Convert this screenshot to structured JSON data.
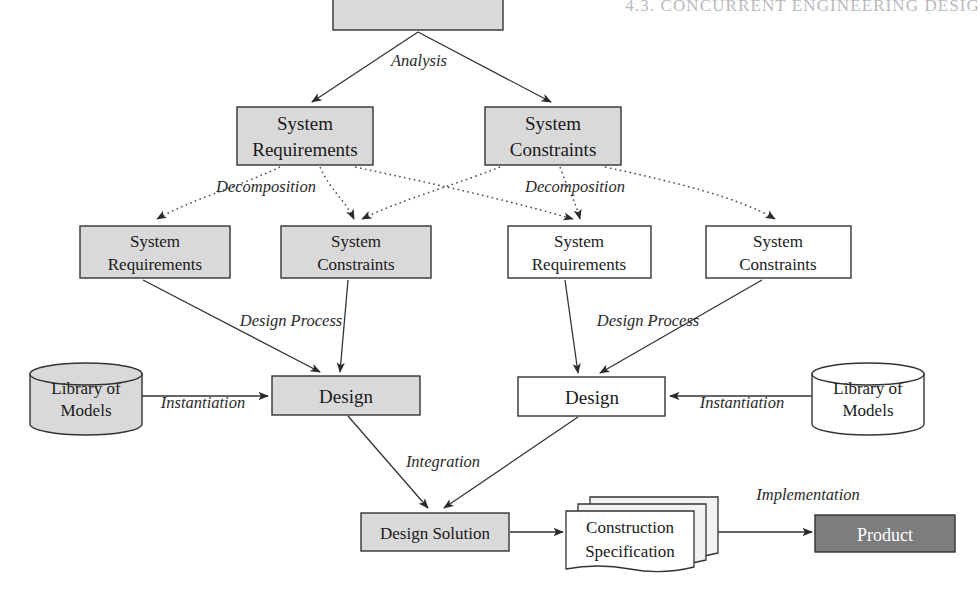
{
  "page": {
    "running_header": "4.3. CONCURRENT ENGINEERING DESIG",
    "width": 980,
    "height": 598
  },
  "colors": {
    "fill_gray": "#d4d4d4",
    "fill_white": "#ffffff",
    "fill_dark": "#7d7d7d",
    "stroke": "#333333",
    "header_text": "#b9b9bd",
    "text_dark": "#1a1a1a",
    "text_light": "#ffffff"
  },
  "diagram": {
    "nodes": [
      {
        "id": "need",
        "name": "need-box",
        "shape": "rect",
        "label": "",
        "fill": "gray",
        "x": 333,
        "y": -18,
        "w": 170,
        "h": 48
      },
      {
        "id": "sys-req-1",
        "name": "system-requirements-box-level1",
        "shape": "rect",
        "label_line1": "System",
        "label_line2": "Requirements",
        "fill": "gray",
        "x": 237,
        "y": 107,
        "w": 136,
        "h": 58
      },
      {
        "id": "sys-con-1",
        "name": "system-constraints-box-level1",
        "shape": "rect",
        "label_line1": "System",
        "label_line2": "Constraints",
        "fill": "gray",
        "x": 485,
        "y": 107,
        "w": 136,
        "h": 58
      },
      {
        "id": "sys-req-2a",
        "name": "system-requirements-box-level2-left",
        "shape": "rect",
        "label_line1": "System",
        "label_line2": "Requirements",
        "fill": "gray",
        "x": 80,
        "y": 226,
        "w": 150,
        "h": 52
      },
      {
        "id": "sys-con-2a",
        "name": "system-constraints-box-level2-left",
        "shape": "rect",
        "label_line1": "System",
        "label_line2": "Constraints",
        "fill": "gray",
        "x": 281,
        "y": 226,
        "w": 150,
        "h": 52
      },
      {
        "id": "sys-req-2b",
        "name": "system-requirements-box-level2-right",
        "shape": "rect",
        "label_line1": "System",
        "label_line2": "Requirements",
        "fill": "white",
        "x": 508,
        "y": 226,
        "w": 143,
        "h": 52
      },
      {
        "id": "sys-con-2b",
        "name": "system-constraints-box-level2-right",
        "shape": "rect",
        "label_line1": "System",
        "label_line2": "Constraints",
        "fill": "white",
        "x": 706,
        "y": 226,
        "w": 145,
        "h": 52
      },
      {
        "id": "lib-left",
        "name": "library-of-models-cylinder-left",
        "shape": "cylinder",
        "label_line1": "Library of",
        "label_line2": "Models",
        "fill": "gray",
        "x": 30,
        "y": 363,
        "w": 112,
        "h": 72
      },
      {
        "id": "design-left",
        "name": "design-box-left",
        "shape": "rect",
        "label": "Design",
        "fill": "gray",
        "x": 272,
        "y": 376,
        "w": 148,
        "h": 39
      },
      {
        "id": "design-right",
        "name": "design-box-right",
        "shape": "rect",
        "label": "Design",
        "fill": "white",
        "x": 518,
        "y": 377,
        "w": 147,
        "h": 39
      },
      {
        "id": "lib-right",
        "name": "library-of-models-cylinder-right",
        "shape": "cylinder",
        "label_line1": "Library of",
        "label_line2": "Models",
        "fill": "white",
        "x": 812,
        "y": 363,
        "w": 112,
        "h": 72
      },
      {
        "id": "design-solution",
        "name": "design-solution-box",
        "shape": "rect",
        "label": "Design Solution",
        "fill": "gray",
        "x": 361,
        "y": 513,
        "w": 148,
        "h": 38
      },
      {
        "id": "construction-spec",
        "name": "construction-specification-document-stack",
        "shape": "document-stack",
        "label_line1": "Construction",
        "label_line2": "Specification",
        "fill": "white",
        "x": 566,
        "y": 501,
        "w": 150,
        "h": 62
      },
      {
        "id": "product",
        "name": "product-box",
        "shape": "rect",
        "label": "Product",
        "fill": "dark",
        "x": 815,
        "y": 515,
        "w": 140,
        "h": 37
      }
    ],
    "edge_labels": [
      {
        "id": "analysis",
        "name": "edge-label-analysis",
        "text": "Analysis",
        "x": 419,
        "y": 66
      },
      {
        "id": "decomp-left",
        "name": "edge-label-decomposition-left",
        "text": "Decomposition",
        "x": 266,
        "y": 192
      },
      {
        "id": "decomp-right",
        "name": "edge-label-decomposition-right",
        "text": "Decomposition",
        "x": 513,
        "y": 192
      },
      {
        "id": "design-process-left",
        "name": "edge-label-design-process-left",
        "text": "Design Process",
        "x": 245,
        "y": 326
      },
      {
        "id": "design-process-right",
        "name": "edge-label-design-process-right",
        "text": "Design Process",
        "x": 588,
        "y": 326
      },
      {
        "id": "instantiation-left",
        "name": "edge-label-instantiation-left",
        "text": "Instantiation",
        "x": 155,
        "y": 406
      },
      {
        "id": "instantiation-right",
        "name": "edge-label-instantiation-right",
        "text": "Instantiation",
        "x": 688,
        "y": 406
      },
      {
        "id": "integration",
        "name": "edge-label-integration",
        "text": "Integration",
        "x": 406,
        "y": 467
      },
      {
        "id": "implementation",
        "name": "edge-label-implementation",
        "text": "Implementation",
        "x": 741,
        "y": 499
      }
    ],
    "edges": [
      {
        "id": "need-to-sysreq1",
        "name": "arrow-need-to-system-requirements",
        "style": "solid",
        "from": "need",
        "to": "sys-req-1"
      },
      {
        "id": "need-to-syscon1",
        "name": "arrow-need-to-system-constraints",
        "style": "solid",
        "from": "need",
        "to": "sys-con-1"
      },
      {
        "id": "sysreq1-to-sysreq2a",
        "name": "arrow-decomposition-req-to-req-left",
        "style": "dotted",
        "from": "sys-req-1",
        "to": "sys-req-2a"
      },
      {
        "id": "sysreq1-to-syscon2a",
        "name": "arrow-decomposition-req-to-con-left",
        "style": "dotted",
        "from": "sys-req-1",
        "to": "sys-con-2a"
      },
      {
        "id": "sysreq1-to-sysreq2b",
        "name": "arrow-decomposition-req-to-req-right",
        "style": "dotted",
        "from": "sys-req-1",
        "to": "sys-req-2b"
      },
      {
        "id": "syscon1-to-syscon2a",
        "name": "arrow-decomposition-con-to-con-left",
        "style": "dotted",
        "from": "sys-con-1",
        "to": "sys-con-2a"
      },
      {
        "id": "syscon1-to-sysreq2b",
        "name": "arrow-decomposition-con-to-req-right",
        "style": "dotted",
        "from": "sys-con-1",
        "to": "sys-req-2b"
      },
      {
        "id": "syscon1-to-syscon2b",
        "name": "arrow-decomposition-con-to-con-right",
        "style": "dotted",
        "from": "sys-con-1",
        "to": "sys-con-2b"
      },
      {
        "id": "sysreq2a-to-designleft",
        "name": "arrow-design-process-left-a",
        "style": "solid",
        "from": "sys-req-2a",
        "to": "design-left"
      },
      {
        "id": "syscon2a-to-designleft",
        "name": "arrow-design-process-left-b",
        "style": "solid",
        "from": "sys-con-2a",
        "to": "design-left"
      },
      {
        "id": "sysreq2b-to-designright",
        "name": "arrow-design-process-right-a",
        "style": "solid",
        "from": "sys-req-2b",
        "to": "design-right"
      },
      {
        "id": "syscon2b-to-designright",
        "name": "arrow-design-process-right-b",
        "style": "solid",
        "from": "sys-con-2b",
        "to": "design-right"
      },
      {
        "id": "libleft-to-designleft",
        "name": "arrow-instantiation-left",
        "style": "solid",
        "from": "lib-left",
        "to": "design-left"
      },
      {
        "id": "libright-to-designright",
        "name": "arrow-instantiation-right",
        "style": "solid",
        "from": "lib-right",
        "to": "design-right"
      },
      {
        "id": "designleft-to-solution",
        "name": "arrow-integration-left",
        "style": "solid",
        "from": "design-left",
        "to": "design-solution"
      },
      {
        "id": "designright-to-solution",
        "name": "arrow-integration-right",
        "style": "solid",
        "from": "design-right",
        "to": "design-solution"
      },
      {
        "id": "solution-to-spec",
        "name": "arrow-design-solution-to-specification",
        "style": "solid",
        "from": "design-solution",
        "to": "construction-spec"
      },
      {
        "id": "spec-to-product",
        "name": "arrow-implementation",
        "style": "solid",
        "from": "construction-spec",
        "to": "product"
      }
    ]
  }
}
